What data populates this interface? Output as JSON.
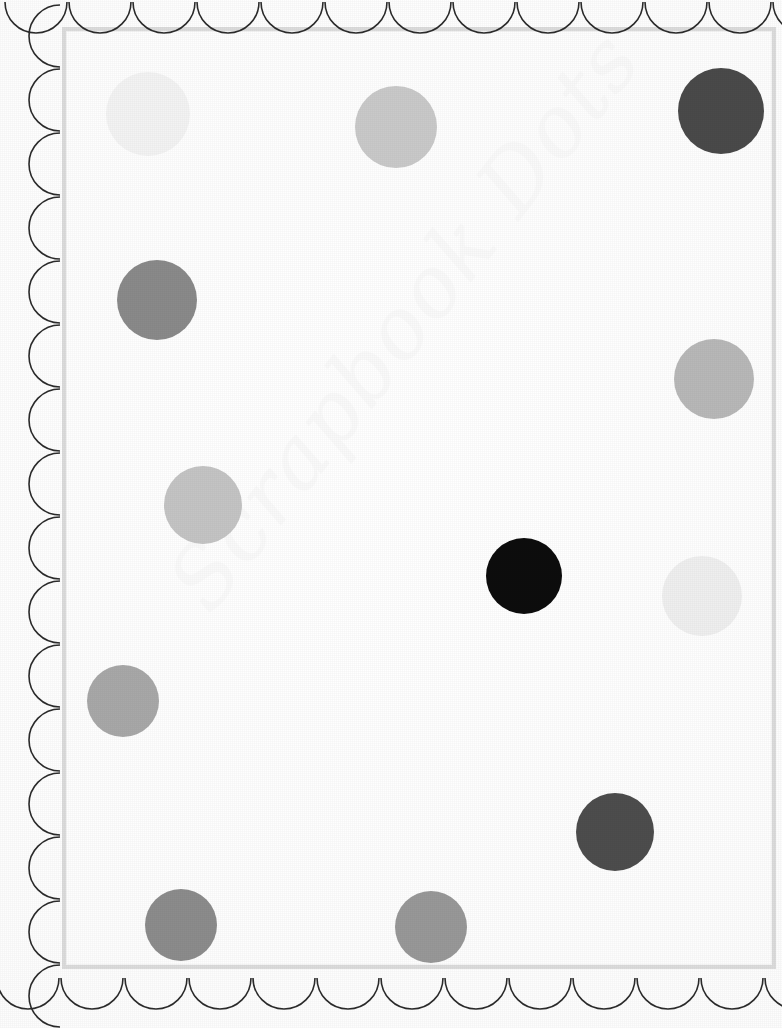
{
  "page": {
    "width": 782,
    "height": 1028,
    "background_color": "#fefefe"
  },
  "watermark": {
    "text": "Scrapbook Dots",
    "color": "#f1f1f1",
    "rotation_deg": -52,
    "opacity": 0.3
  },
  "frame": {
    "border_color": "#dcdcdc",
    "inner_hairline_color": "#f4f4f4",
    "left": 62,
    "top": 27,
    "width": 714,
    "height": 942,
    "border_width": 4
  },
  "scallop_border": {
    "stroke_color": "#2b2b2b",
    "stroke_width": 1.6,
    "fill": "none",
    "radius": 31,
    "edges": [
      "top",
      "left",
      "bottom"
    ],
    "top_count": 12,
    "left_count": 16,
    "bottom_count": 12
  },
  "dots": [
    {
      "name": "dot-1",
      "cx": 148,
      "cy": 114,
      "r": 42,
      "color": "#f3f3f3"
    },
    {
      "name": "dot-2",
      "cx": 396,
      "cy": 127,
      "r": 41,
      "color": "#c9c9c9"
    },
    {
      "name": "dot-3",
      "cx": 721,
      "cy": 111,
      "r": 43,
      "color": "#4a4a4a"
    },
    {
      "name": "dot-4",
      "cx": 157,
      "cy": 300,
      "r": 40,
      "color": "#8a8a8a"
    },
    {
      "name": "dot-5",
      "cx": 714,
      "cy": 379,
      "r": 40,
      "color": "#b8b8b8"
    },
    {
      "name": "dot-6",
      "cx": 203,
      "cy": 505,
      "r": 39,
      "color": "#c4c4c4"
    },
    {
      "name": "dot-7",
      "cx": 524,
      "cy": 576,
      "r": 38,
      "color": "#0d0d0d"
    },
    {
      "name": "dot-8",
      "cx": 702,
      "cy": 596,
      "r": 40,
      "color": "#efefef"
    },
    {
      "name": "dot-9",
      "cx": 123,
      "cy": 701,
      "r": 36,
      "color": "#a8a8a8"
    },
    {
      "name": "dot-10",
      "cx": 615,
      "cy": 832,
      "r": 39,
      "color": "#4d4d4d"
    },
    {
      "name": "dot-11",
      "cx": 181,
      "cy": 925,
      "r": 36,
      "color": "#8c8c8c"
    },
    {
      "name": "dot-12",
      "cx": 431,
      "cy": 927,
      "r": 36,
      "color": "#989898"
    }
  ]
}
